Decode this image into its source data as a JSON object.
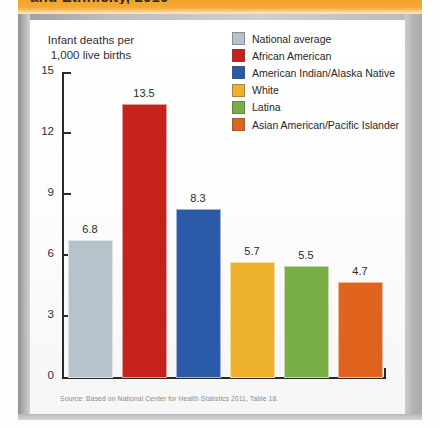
{
  "figure": {
    "cut_off_title": "and Ethnicity, 2010",
    "axis_caption_line1": "Infant deaths per",
    "axis_caption_line2": "1,000 live births",
    "source": "Source: Based on National Center for Health Statistics 2011, Table 18."
  },
  "chart_data": {
    "type": "bar",
    "title": "",
    "xlabel": "",
    "ylabel": "Infant deaths per 1,000 live births",
    "ylim": [
      0,
      15
    ],
    "yticks": [
      "0",
      "3",
      "6",
      "9",
      "12",
      "15"
    ],
    "grid": false,
    "legend_position": "top-right",
    "categories": [
      "National average",
      "African American",
      "American Indian/Alaska Native",
      "White",
      "Latina",
      "Asian American/Pacific Islander"
    ],
    "values": [
      6.8,
      13.5,
      8.3,
      5.7,
      5.5,
      4.7
    ],
    "value_labels": [
      "6.8",
      "13.5",
      "8.3",
      "5.7",
      "5.5",
      "4.7"
    ],
    "colors": [
      "#b7c3cb",
      "#c6211a",
      "#2b5aa8",
      "#eeb12b",
      "#79ad45",
      "#e0641e"
    ]
  },
  "legend": [
    {
      "label": "National average",
      "color": "#b7c3cb"
    },
    {
      "label": "African American",
      "color": "#c6211a"
    },
    {
      "label": "American Indian/Alaska Native",
      "color": "#2b5aa8"
    },
    {
      "label": "White",
      "color": "#eeb12b"
    },
    {
      "label": "Latina",
      "color": "#79ad45"
    },
    {
      "label": "Asian American/Pacific Islander",
      "color": "#e0641e"
    }
  ]
}
